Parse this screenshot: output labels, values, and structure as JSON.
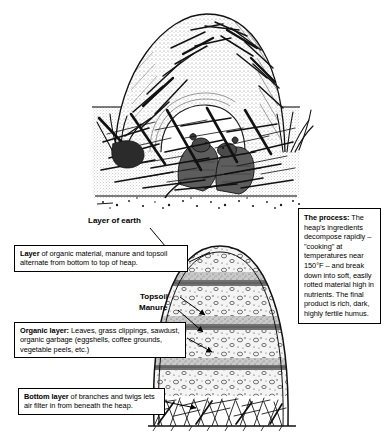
{
  "figure": {
    "title_illustration": "animal-lodge-cutaway-drawing",
    "diagram": "compost-heap-cross-section"
  },
  "labels": {
    "layer_of_earth": "Layer of earth",
    "topsoil": "Topsoil",
    "manure": "Manure"
  },
  "callouts": {
    "layer_organic": {
      "lead": "Layer",
      "body": " of organic material, manure and topsoil alternate from bottom to top of heap."
    },
    "organic_layer": {
      "lead": "Organic layer:",
      "body": " Leaves, grass clippings, sawdust, organic garbage (eggshells, coffee grounds, vegetable peels, etc.)"
    },
    "bottom_layer": {
      "lead": "Bottom layer",
      "body": " of branches and twigs lets air filter in from beneath the heap."
    },
    "process": {
      "lead": "The process:",
      "body": " The heap's ingredients decompose rapidly – \"cooking\" at temperatures near 150°F – and break down into soft, easily rotted material high in nutrients. The final product is rich, dark, highly fertile humus."
    }
  },
  "colors": {
    "ink": "#000000",
    "paper": "#ffffff",
    "earth_band": "#9a9a9a",
    "manure_band": "#6f6f6f",
    "organic_fill": "#efefef"
  },
  "diagram_layers": [
    {
      "name": "layer-of-earth",
      "kind": "earth",
      "order": 1
    },
    {
      "name": "organic-layer-top",
      "kind": "organic",
      "order": 2
    },
    {
      "name": "topsoil-band",
      "kind": "topsoil",
      "order": 3
    },
    {
      "name": "manure-band",
      "kind": "manure",
      "order": 4
    },
    {
      "name": "organic-layer-middle",
      "kind": "organic",
      "order": 5
    },
    {
      "name": "topsoil-band-2",
      "kind": "topsoil",
      "order": 6
    },
    {
      "name": "manure-band-2",
      "kind": "manure",
      "order": 7
    },
    {
      "name": "organic-layer-lower",
      "kind": "organic",
      "order": 8
    },
    {
      "name": "topsoil-band-3",
      "kind": "topsoil",
      "order": 9
    },
    {
      "name": "organic-layer-bottom",
      "kind": "organic",
      "order": 10
    },
    {
      "name": "bottom-layer-branches",
      "kind": "branches",
      "order": 11
    }
  ]
}
